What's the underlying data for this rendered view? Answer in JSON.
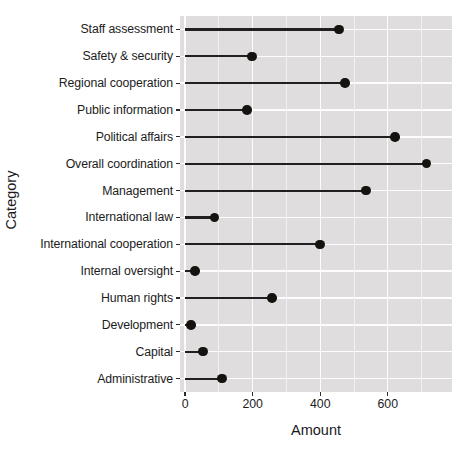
{
  "chart_data": {
    "type": "bar",
    "subtype": "lollipop-horizontal",
    "title": "",
    "xlabel": "Amount",
    "ylabel": "Category",
    "orientation": "horizontal",
    "grid": true,
    "legend": false,
    "xlim": [
      -15,
      790
    ],
    "xticks": [
      0,
      200,
      400,
      600
    ],
    "xtick_labels": [
      "0",
      "200",
      "400",
      "600"
    ],
    "panel_background": "#e0dddf",
    "gridline_color": "#fdfdfd",
    "marker_color": "#16120f",
    "stem_color": "#231f20",
    "categories": [
      "Staff assessment",
      "Safety & security",
      "Regional cooperation",
      "Public information",
      "Political affairs",
      "Overall coordination",
      "Management",
      "International law",
      "International cooperation",
      "Internal oversight",
      "Human rights",
      "Development",
      "Capital",
      "Administrative"
    ],
    "values": [
      456,
      198,
      474,
      184,
      622,
      714,
      536,
      87,
      400,
      30,
      258,
      18,
      53,
      110
    ]
  }
}
